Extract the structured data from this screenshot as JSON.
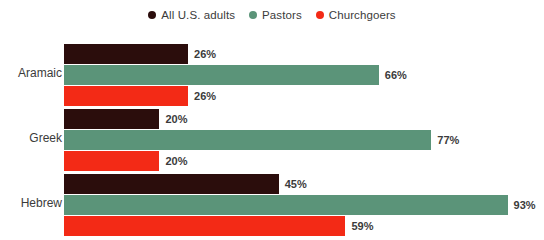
{
  "chart_data": {
    "type": "bar",
    "orientation": "horizontal",
    "title": "",
    "subtitle": "",
    "xlabel": "",
    "ylabel": "",
    "grid": false,
    "xlim": [
      0,
      100
    ],
    "legend_position": "top-center",
    "categories": [
      "Aramaic",
      "Greek",
      "Hebrew"
    ],
    "value_suffix": "%",
    "series": [
      {
        "name": "All U.S. adults",
        "color": "#2b0d0c",
        "values": [
          26,
          20,
          45
        ],
        "labels": [
          "26%",
          "20%",
          "45%"
        ]
      },
      {
        "name": "Pastors",
        "color": "#5b9479",
        "values": [
          66,
          77,
          93
        ],
        "labels": [
          "66%",
          "77%",
          "93%"
        ]
      },
      {
        "name": "Churchgoers",
        "color": "#f32a16",
        "values": [
          26,
          20,
          59
        ],
        "labels": [
          "26%",
          "20%",
          "59%"
        ]
      }
    ]
  },
  "legend": {
    "items": [
      {
        "label": "All U.S. adults",
        "color": "#2b0d0c"
      },
      {
        "label": "Pastors",
        "color": "#5b9479"
      },
      {
        "label": "Churchgoers",
        "color": "#f32a16"
      }
    ]
  },
  "axis": {
    "category_labels": [
      "Aramaic",
      "Greek",
      "Hebrew"
    ]
  }
}
